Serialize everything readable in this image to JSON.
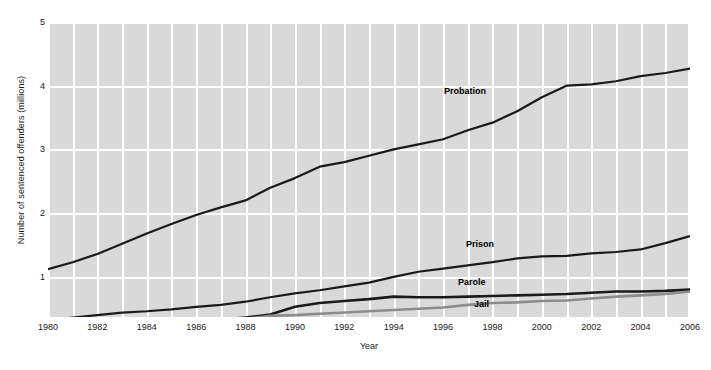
{
  "chart_data": {
    "type": "line",
    "title": "",
    "xlabel": "Year",
    "ylabel": "Number of sentenced offenders (millions)",
    "xlim": [
      1980,
      2006
    ],
    "ylim": [
      0.37,
      5
    ],
    "grid": true,
    "legend_position": "inline-labels",
    "x_tick_labels": [
      "1980",
      "1982",
      "1984",
      "1986",
      "1988",
      "1990",
      "1992",
      "1994",
      "1996",
      "1998",
      "2000",
      "2002",
      "2004",
      "2006"
    ],
    "y_tick_labels": [
      "1",
      "2",
      "3",
      "4",
      "5"
    ],
    "x": [
      1980,
      1981,
      1982,
      1983,
      1984,
      1985,
      1986,
      1987,
      1988,
      1989,
      1990,
      1991,
      1992,
      1993,
      1994,
      1995,
      1996,
      1997,
      1998,
      1999,
      2000,
      2001,
      2002,
      2003,
      2004,
      2005,
      2006
    ],
    "series": [
      {
        "name": "Probation",
        "color": "#1a1a1a",
        "width": 2.2,
        "values": [
          1.12,
          1.23,
          1.36,
          1.52,
          1.68,
          1.83,
          1.97,
          2.09,
          2.2,
          2.4,
          2.55,
          2.73,
          2.8,
          2.9,
          3.0,
          3.08,
          3.16,
          3.3,
          3.42,
          3.6,
          3.82,
          4.0,
          4.02,
          4.07,
          4.15,
          4.2,
          4.27
        ]
      },
      {
        "name": "Prison",
        "color": "#1a1a1a",
        "width": 2.2,
        "values": [
          0.32,
          0.36,
          0.4,
          0.44,
          0.46,
          0.49,
          0.53,
          0.56,
          0.61,
          0.68,
          0.74,
          0.79,
          0.85,
          0.91,
          1.0,
          1.08,
          1.13,
          1.18,
          1.23,
          1.29,
          1.32,
          1.33,
          1.37,
          1.39,
          1.43,
          1.53,
          1.64
        ]
      },
      {
        "name": "Parole",
        "color": "#1a1a1a",
        "width": 2.6,
        "values": [
          0.22,
          0.23,
          0.25,
          0.27,
          0.27,
          0.28,
          0.3,
          0.33,
          0.36,
          0.41,
          0.53,
          0.59,
          0.62,
          0.65,
          0.69,
          0.68,
          0.68,
          0.69,
          0.7,
          0.71,
          0.72,
          0.73,
          0.75,
          0.77,
          0.77,
          0.78,
          0.8
        ]
      },
      {
        "name": "Jail",
        "color": "#8c8c8c",
        "width": 2.6,
        "values": [
          0.18,
          0.2,
          0.21,
          0.22,
          0.23,
          0.26,
          0.27,
          0.29,
          0.34,
          0.39,
          0.4,
          0.42,
          0.44,
          0.46,
          0.48,
          0.5,
          0.52,
          0.56,
          0.59,
          0.6,
          0.62,
          0.63,
          0.66,
          0.69,
          0.71,
          0.73,
          0.77
        ]
      }
    ],
    "series_label_positions": [
      {
        "name": "Probation",
        "left": 444,
        "top": 86
      },
      {
        "name": "Prison",
        "left": 466,
        "top": 239
      },
      {
        "name": "Parole",
        "left": 458,
        "top": 277
      },
      {
        "name": "Jail",
        "left": 474,
        "top": 299
      }
    ],
    "colors": {
      "plot_background": "#d9d9d9",
      "gridline": "#ffffff",
      "dark_line": "#1a1a1a",
      "gray_line": "#8c8c8c",
      "text": "#1a1a1a",
      "figure_background": "#ffffff"
    }
  }
}
